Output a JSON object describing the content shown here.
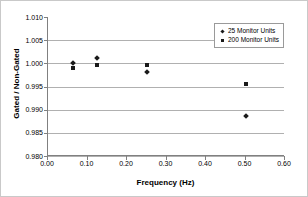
{
  "chart_data": {
    "type": "scatter",
    "title": "",
    "xlabel": "Frequency (Hz)",
    "ylabel": "Gated / Non-Gated",
    "xlim": [
      0.0,
      0.6
    ],
    "ylim": [
      0.98,
      1.01
    ],
    "xticks": [
      "0.00",
      "0.10",
      "0.20",
      "0.30",
      "0.40",
      "0.50",
      "0.60"
    ],
    "xtick_values": [
      0.0,
      0.1,
      0.2,
      0.3,
      0.4,
      0.5,
      0.6
    ],
    "yticks": [
      "0.980",
      "0.985",
      "0.990",
      "0.995",
      "1.000",
      "1.005",
      "1.010"
    ],
    "ytick_values": [
      0.98,
      0.985,
      0.99,
      0.995,
      1.0,
      1.005,
      1.01
    ],
    "grid": "horizontal",
    "legend_position": "top-right",
    "marker_color": "#1a1a1a",
    "series": [
      {
        "name": "25 Monitor Units",
        "marker": "diamond",
        "x": [
          0.0625,
          0.125,
          0.25,
          0.5
        ],
        "y": [
          1.0,
          1.0012,
          0.9981,
          0.9886
        ]
      },
      {
        "name": "200 Monitor Units",
        "marker": "square",
        "x": [
          0.0625,
          0.125,
          0.25,
          0.5
        ],
        "y": [
          0.9991,
          0.9996,
          0.9996,
          0.9955
        ]
      }
    ]
  },
  "legend": {
    "items": [
      {
        "label": "25 Monitor Units",
        "marker": "diamond"
      },
      {
        "label": "200 Monitor Units",
        "marker": "square"
      }
    ]
  }
}
